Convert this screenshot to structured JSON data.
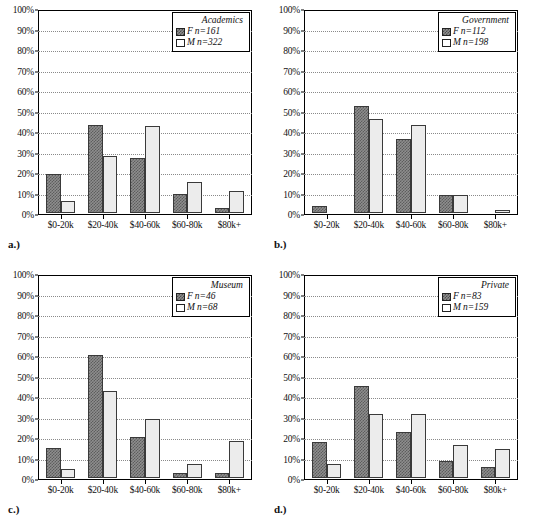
{
  "figure": {
    "footnote": ""
  },
  "axis": {
    "y_ticks": [
      "0%",
      "10%",
      "20%",
      "30%",
      "40%",
      "50%",
      "60%",
      "70%",
      "80%",
      "90%",
      "100%"
    ],
    "x_categories": [
      "$0-20k",
      "$20-40k",
      "$40-60k",
      "$60-80k",
      "$80k+"
    ]
  },
  "series_keys": {
    "female_symbol": "F",
    "male_symbol": "M"
  },
  "panels": [
    {
      "caption": "a.)",
      "legend_title": "Academics",
      "female_n": "n=161",
      "male_n": "n=322",
      "female_label": "F",
      "male_label": "M"
    },
    {
      "caption": "b.)",
      "legend_title": "Government",
      "female_n": "n=112",
      "male_n": "n=198",
      "female_label": "F",
      "male_label": "M"
    },
    {
      "caption": "c.)",
      "legend_title": "Museum",
      "female_n": "n=46",
      "male_n": "n=68",
      "female_label": "F",
      "male_label": "M"
    },
    {
      "caption": "d.)",
      "legend_title": "Private",
      "female_n": "n=83",
      "male_n": "n=159",
      "female_label": "F",
      "male_label": "M"
    }
  ],
  "chart_data": [
    {
      "type": "bar",
      "title": "Academics",
      "panel": "a.)",
      "categories": [
        "$0-20k",
        "$20-40k",
        "$40-60k",
        "$60-80k",
        "$80k+"
      ],
      "series": [
        {
          "name": "F n=161",
          "values": [
            19.5,
            44.0,
            27.5,
            9.5,
            2.5
          ]
        },
        {
          "name": "M n=322",
          "values": [
            6.0,
            28.5,
            43.5,
            15.5,
            11.0
          ]
        }
      ],
      "xlabel": "",
      "ylabel": "",
      "ylim": [
        0,
        100
      ],
      "ytick_step": 10,
      "grid": true,
      "legend_position": "top-right"
    },
    {
      "type": "bar",
      "title": "Government",
      "panel": "b.)",
      "categories": [
        "$0-20k",
        "$20-40k",
        "$40-60k",
        "$60-80k",
        "$80k+"
      ],
      "series": [
        {
          "name": "F n=112",
          "values": [
            3.5,
            53.0,
            37.0,
            9.0,
            0.0
          ]
        },
        {
          "name": "M n=198",
          "values": [
            0.0,
            47.0,
            44.0,
            9.0,
            1.5
          ]
        }
      ],
      "xlabel": "",
      "ylabel": "",
      "ylim": [
        0,
        100
      ],
      "ytick_step": 10,
      "grid": true,
      "legend_position": "top-right"
    },
    {
      "type": "bar",
      "title": "Museum",
      "panel": "c.)",
      "categories": [
        "$0-20k",
        "$20-40k",
        "$40-60k",
        "$60-80k",
        "$80k+"
      ],
      "series": [
        {
          "name": "F n=46",
          "values": [
            15.0,
            61.0,
            20.5,
            2.5,
            2.5
          ]
        },
        {
          "name": "M n=68",
          "values": [
            4.5,
            43.5,
            29.5,
            7.0,
            18.5
          ]
        }
      ],
      "xlabel": "",
      "ylabel": "",
      "ylim": [
        0,
        100
      ],
      "ytick_step": 10,
      "grid": true,
      "legend_position": "top-right"
    },
    {
      "type": "bar",
      "title": "Private",
      "panel": "d.)",
      "categories": [
        "$0-20k",
        "$20-40k",
        "$40-60k",
        "$60-80k",
        "$80k+"
      ],
      "series": [
        {
          "name": "F n=83",
          "values": [
            18.0,
            46.0,
            23.0,
            8.5,
            5.5
          ]
        },
        {
          "name": "M n=159",
          "values": [
            7.0,
            32.0,
            32.0,
            16.5,
            14.5
          ]
        }
      ],
      "xlabel": "",
      "ylabel": "",
      "ylim": [
        0,
        100
      ],
      "ytick_step": 10,
      "grid": true,
      "legend_position": "top-right"
    }
  ]
}
